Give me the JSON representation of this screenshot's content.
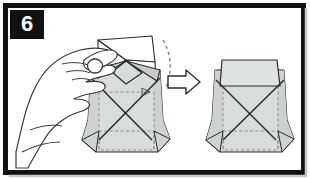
{
  "panel": {
    "step_number": "6",
    "border_color": "#111111",
    "background_color": "#ffffff",
    "width": 310,
    "height": 179
  },
  "colors": {
    "paper_fill": "#d9dcdc",
    "paper_fill_light": "#e6e8e8",
    "paper_white": "#ffffff",
    "outline": "#2b2b2b",
    "fold_dashed": "#8a8a8a",
    "hand_fill": "#ffffff",
    "hand_outline": "#3a3a3a",
    "badge_bg": "#111111",
    "badge_text": "#ffffff"
  },
  "figures": {
    "hand": {
      "name": "left-hand-pinching",
      "description": "Left hand with thumb and index finger pinching the top flap of the paper model"
    },
    "model_before": {
      "name": "origami-model-open",
      "description": "Cup-shaped paper model with top flap opened outward showing white inner triangles and X crease lines"
    },
    "model_after": {
      "name": "origami-model-closed",
      "description": "Cup-shaped paper model with top flap folded flat and closed, X crease lines visible"
    },
    "arrow": {
      "name": "step-result-arrow",
      "direction": "right",
      "style": "outlined"
    },
    "motion_hint": {
      "name": "fold-motion-dashed-curve",
      "description": "Dashed curved line indicating the flap travel path"
    }
  }
}
